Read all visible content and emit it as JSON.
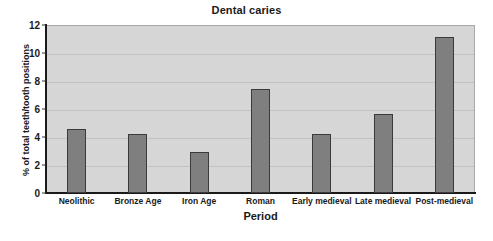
{
  "chart_data": {
    "type": "bar",
    "title": "Dental caries",
    "xlabel": "Period",
    "ylabel": "% of total teeth/tooth positions",
    "categories": [
      "Neolithic",
      "Bronze Age",
      "Iron Age",
      "Roman",
      "Early medieval",
      "Late medieval",
      "Post-medieval"
    ],
    "values": [
      4.6,
      4.2,
      2.9,
      7.45,
      4.25,
      5.65,
      11.15
    ],
    "ylim": [
      0,
      12
    ],
    "yticks": [
      0,
      2,
      4,
      6,
      8,
      10,
      12
    ],
    "ytick_labels": [
      "0",
      "2",
      "4",
      "6",
      "8",
      "10",
      "12"
    ],
    "grid": true,
    "grid_axis": "y",
    "legend": false,
    "series": [
      {
        "name": "Dental caries",
        "values": [
          4.6,
          4.2,
          2.9,
          7.45,
          4.25,
          5.65,
          11.15
        ]
      }
    ],
    "colors": {
      "bar_fill": "#7f7f7f",
      "bar_edge": "#3b3b3b",
      "plot_background": "#d6d6d6",
      "figure_background": "#ffffff",
      "axis": "#1a1a1a",
      "gridline": "#c2c2c2",
      "text": "#1a1a1a"
    }
  }
}
